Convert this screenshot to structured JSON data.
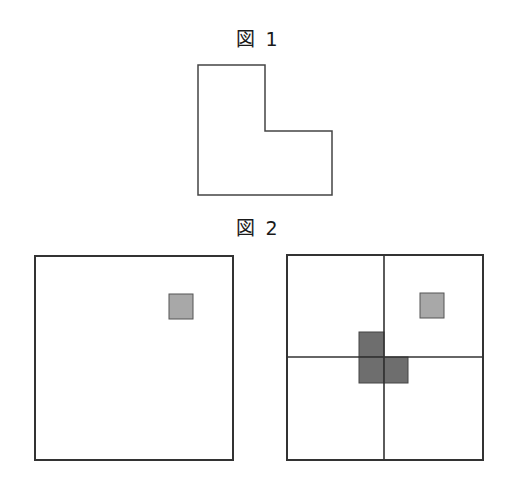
{
  "figure1": {
    "label": "図 1",
    "shape": "L-shape outline"
  },
  "figure2": {
    "label": "図 2",
    "left_panel": {
      "description": "large square with one light gray small square in upper-right area"
    },
    "right_panel": {
      "description": "large square divided into 4 quadrants, light gray small square in top-right quadrant, dark gray L-shaped tromino at center"
    }
  },
  "colors": {
    "stroke": "#333333",
    "light_fill": "#a8a8a8",
    "dark_fill": "#6e6e6e",
    "background": "#ffffff"
  }
}
